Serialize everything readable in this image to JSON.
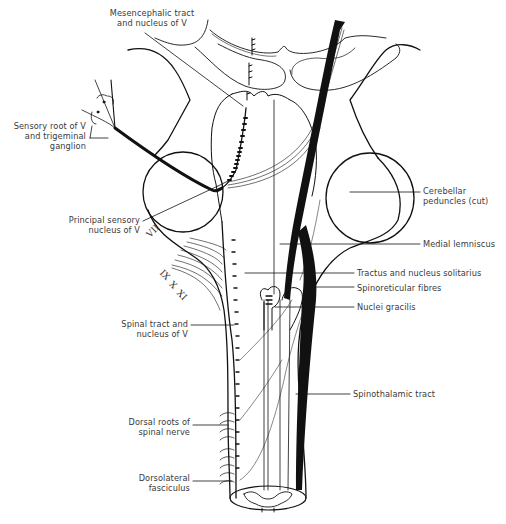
{
  "diagram": {
    "labels": {
      "mesencephalic": [
        "Mesencephalic tract",
        "and nucleus of V"
      ],
      "sensory_root": [
        "Sensory root of V",
        "and trigeminal",
        "ganglion"
      ],
      "cerebellar": [
        "Cerebellar",
        "peduncles (cut)"
      ],
      "principal": [
        "Principal sensory",
        "nucleus of V"
      ],
      "medial_lemniscus": "Medial lemniscus",
      "tractus_solitarius": "Tractus and nucleus solitarius",
      "spinoreticular": "Spinoreticular fibres",
      "nuclei_gracilis": "Nuclei gracilis",
      "spinal_tract": [
        "Spinal tract and",
        "nucleus of V"
      ],
      "spinothalamic": "Spinothalamic tract",
      "dorsal_roots": [
        "Dorsal roots of",
        "spinal nerve"
      ],
      "dorsolateral": [
        "Dorsolateral",
        "fasciculus"
      ]
    },
    "cranial_nerves": {
      "vii": "VII",
      "ix": "IX",
      "x": "X",
      "xi": "XI"
    },
    "colors": {
      "ink": "#111111",
      "label_text": "#3a3a3a",
      "background": "#ffffff"
    }
  }
}
